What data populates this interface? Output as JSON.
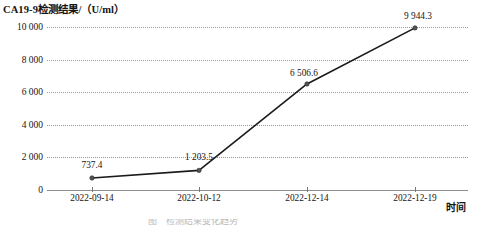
{
  "chart_data": {
    "type": "line",
    "title": "",
    "ylabel": "CA19-9检测结果/（U/ml）",
    "xlabel": "时间",
    "categories": [
      "2022-09-14",
      "2022-10-12",
      "2022-12-14",
      "2022-12-19"
    ],
    "values": [
      737.4,
      1203.5,
      6506.6,
      9944.3
    ],
    "point_labels": [
      "737.4",
      "1 203.5",
      "6 506.6",
      "9 944.3"
    ],
    "ylim": [
      0,
      10000
    ],
    "yticks": [
      0,
      2000,
      4000,
      6000,
      8000,
      10000
    ],
    "ytick_labels": [
      "0",
      "2 000",
      "4 000",
      "6 000",
      "8 000",
      "10 000"
    ],
    "grid": true,
    "legend": "none",
    "series_color": "#1a1a1a",
    "grid_color": "#9a9a9a",
    "axis_color": "#8c8c8c"
  },
  "caption": {
    "clipped_text": "图　检测结果变化趋势"
  }
}
